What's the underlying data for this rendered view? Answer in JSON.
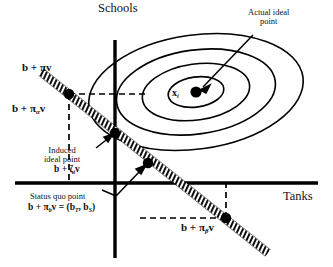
{
  "figure": {
    "type": "spatial-voting-diagram",
    "background_color": "#ffffff",
    "ink_color": "#000000"
  },
  "axes": {
    "vertical_label": "Schools",
    "horizontal_label": "Tanks",
    "origin_px": [
      115,
      183
    ],
    "vertical_extent_px": [
      40,
      258
    ],
    "horizontal_extent_px": [
      15,
      318
    ]
  },
  "ideal_point": {
    "marker_label": "x",
    "marker_subscript": "i",
    "annotation_line1": "Actual ideal",
    "annotation_line2": "point",
    "center_px": [
      196,
      92
    ]
  },
  "indifference_curves": {
    "count": 4,
    "shape": "ellipse",
    "rotation_deg": -8,
    "radii_px": [
      [
        108,
        57
      ],
      [
        80,
        42
      ],
      [
        54,
        28
      ],
      [
        28,
        15
      ]
    ]
  },
  "constraint_line": {
    "style": "hatched-band",
    "label_top": "b + πv",
    "points": [
      {
        "name": "pi-alpha-point",
        "label_prefix": "b + ",
        "greek": "π",
        "subscript": "α",
        "suffix": "v",
        "px": [
          69,
          94
        ]
      },
      {
        "name": "induced-ideal-point",
        "annotation_line1": "Induced",
        "annotation_line2": "ideal point",
        "label_prefix": "b + ",
        "greek": "ζ",
        "subscript": "i",
        "suffix": "v",
        "px": [
          115,
          133
        ]
      },
      {
        "name": "status-quo-point",
        "annotation": "Status quo point",
        "label_prefix": "b + ",
        "greek": "π",
        "subscript": "b",
        "suffix": "v = (b",
        "sub_t": "T",
        "mid": ", b",
        "sub_s": "S",
        "close": ")",
        "px": [
          148,
          163
        ]
      },
      {
        "name": "pi-beta-point",
        "label_prefix": "b + ",
        "greek": "π",
        "subscript": "β",
        "suffix": "v",
        "px": [
          226,
          218
        ]
      }
    ]
  },
  "labels": {
    "b_plus_pi_v": "b + πv",
    "b_plus_pi_alpha_v_prefix": "b + ",
    "induced_line1": "Induced",
    "induced_line2": "ideal point",
    "status_quo": "Status quo point",
    "actual_ideal_line1": "Actual ideal",
    "actual_ideal_line2": "point",
    "pi": "π",
    "zeta": "ζ",
    "alpha": "α",
    "beta": "β",
    "v": "v",
    "b": "b",
    "sub_i": "i",
    "sub_b": "b",
    "sub_T": "T",
    "sub_S": "S",
    "eq_open": "v = (b",
    "eq_mid": ", b",
    "eq_close": ")",
    "x_symbol": "x"
  }
}
